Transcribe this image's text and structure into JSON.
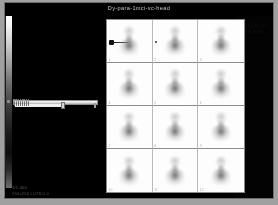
{
  "window": {
    "title": "Dy-para-1mci-vc-head",
    "background_color": "#000000",
    "frame_color": "#a0a0a0"
  },
  "control_panel": {
    "colorbar": {
      "name": "grayscale-intensity-colorbar",
      "orientation": "vertical",
      "top_label": "max",
      "bottom_label": "min"
    },
    "slider": {
      "label": "Window",
      "value_percent": 55,
      "min": 0,
      "max": 100
    },
    "status": {
      "line1": "1/1 400",
      "line2": "256x256 LUT8.0.0"
    }
  },
  "right_margin": {
    "text": "sc ref 1 kv re t n vo sl te ao ws"
  },
  "grid": {
    "columns": 3,
    "rows": 4,
    "cells": [
      {
        "tag": "1",
        "annotation": "arrow"
      },
      {
        "tag": "2",
        "annotation": "dot"
      },
      {
        "tag": "3",
        "annotation": ""
      },
      {
        "tag": "4",
        "annotation": ""
      },
      {
        "tag": "5",
        "annotation": ""
      },
      {
        "tag": "6",
        "annotation": ""
      },
      {
        "tag": "7",
        "annotation": ""
      },
      {
        "tag": "8",
        "annotation": ""
      },
      {
        "tag": "9",
        "annotation": ""
      },
      {
        "tag": "10",
        "annotation": ""
      },
      {
        "tag": "11",
        "annotation": ""
      },
      {
        "tag": "12",
        "annotation": ""
      }
    ]
  }
}
